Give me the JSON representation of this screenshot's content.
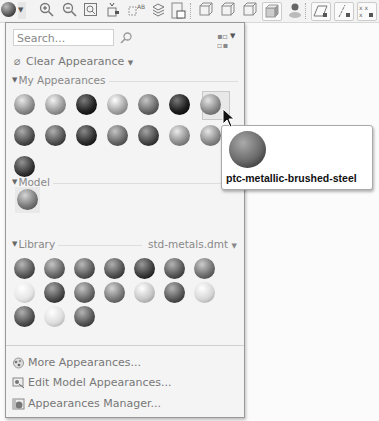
{
  "toolbar": {
    "items": [
      {
        "name": "appearance-gallery-button",
        "icon": "sphere"
      },
      {
        "name": "zoom-in-icon",
        "icon": "🔍+"
      },
      {
        "name": "zoom-out-icon",
        "icon": "🔍-"
      },
      {
        "name": "refit-icon",
        "icon": "⊡"
      },
      {
        "name": "reorient-icon",
        "icon": "⤢"
      },
      {
        "name": "saved-views-icon",
        "icon": "▦"
      },
      {
        "name": "layers-icon",
        "icon": "≋"
      },
      {
        "name": "view-manager-icon",
        "icon": "▣"
      },
      {
        "name": "display-style-wireframe-icon",
        "icon": "▢"
      },
      {
        "name": "display-style-hidden-icon",
        "icon": "▢"
      },
      {
        "name": "display-style-nohidden-icon",
        "icon": "▢"
      },
      {
        "name": "display-style-shading-icon",
        "icon": "■"
      },
      {
        "name": "perspective-icon",
        "icon": "●"
      },
      {
        "name": "plane-display-icon",
        "icon": "▱"
      },
      {
        "name": "axis-display-icon",
        "icon": "/"
      },
      {
        "name": "point-display-icon",
        "icon": "×"
      }
    ]
  },
  "panel": {
    "search": {
      "placeholder": "Search..."
    },
    "clear_appearance": "Clear Appearance",
    "my_appearances": {
      "label": "My Appearances",
      "spheres": [
        "#8e8e8e",
        "#999999",
        "#222222",
        "#a5a5a5",
        "#6c6c6c",
        "#1e1e1e",
        "#8a8a8a",
        "#525252",
        "#555555",
        "#2f2f2f",
        "#6a6a6a",
        "#4a4a4a",
        "#909090",
        "#8c8c8c",
        "#393939"
      ],
      "selected_index": 6
    },
    "model": {
      "label": "Model",
      "spheres": [
        "#7b7b7b"
      ]
    },
    "library": {
      "label": "Library",
      "file": "std-metals.dmt",
      "spheres": [
        "#5c5c5c",
        "#6a6a6a",
        "#5e5e5e",
        "#555555",
        "#3e3e3e",
        "#5a5a5a",
        "#727272",
        "#e6e6e6",
        "#4e4e4e",
        "#6a6a6a",
        "#7a7a7a",
        "#c8c8c8",
        "#5a5a5a",
        "#d8d8d8",
        "#555555",
        "#dedede",
        "#5a5a5a"
      ]
    },
    "menu": [
      {
        "label": "More Appearances...",
        "icon": "more-appearances-icon"
      },
      {
        "label": "Edit Model Appearances...",
        "icon": "edit-appearances-icon"
      },
      {
        "label": "Appearances Manager...",
        "icon": "appearances-manager-icon"
      }
    ]
  },
  "tooltip": {
    "label": "ptc-metallic-brushed-steel"
  }
}
